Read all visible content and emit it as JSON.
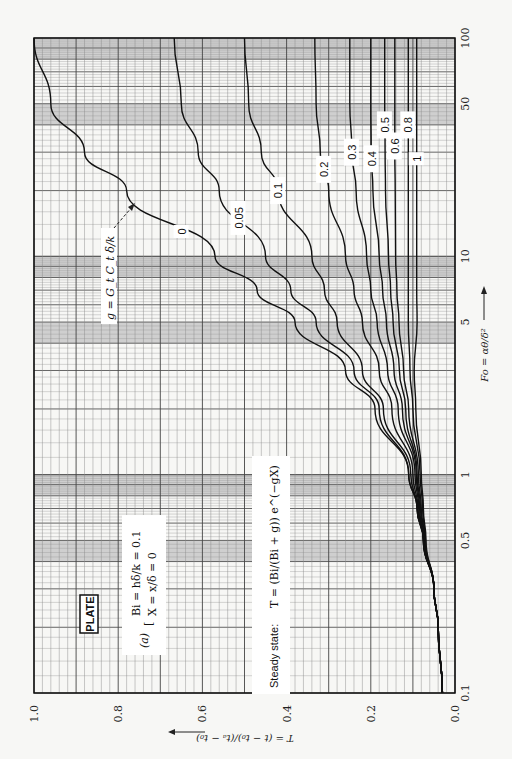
{
  "chart_data": {
    "type": "line",
    "title": "PLATE",
    "orientation": "rotated 90° counter-clockwise (x-axis runs bottom-to-top, y-axis runs right-to-left)",
    "xlabel": "Fo = αθ/δ²",
    "ylabel": "T = (t − t₀)/(tₐ − t₀)",
    "xscale": "log",
    "xlim": [
      0.1,
      100
    ],
    "ylim": [
      0.0,
      1.0
    ],
    "x_ticks": [
      0.1,
      0.5,
      1,
      5,
      10,
      50,
      100
    ],
    "x_tick_labels": [
      "0.1",
      "0.5",
      "1",
      "5",
      "10",
      "50",
      "100"
    ],
    "y_ticks": [
      0.0,
      0.2,
      0.4,
      0.6,
      0.8,
      1.0
    ],
    "y_tick_labels": [
      "0.0",
      "0.2",
      "0.4",
      "0.6",
      "0.8",
      "1.0"
    ],
    "grid": true,
    "legend": "none (inline curve labels)",
    "parameter_name": "g = G_t C_t δ/k",
    "case_label": "(a)",
    "conditions": [
      "Bi = hδ/k = 0.1",
      "X = x/δ = 0"
    ],
    "steady_state_text": "Steady state:",
    "steady_state_formula": "T = (Bi/(Bi + g)) e^(−gX)",
    "x": [
      0.1,
      0.2,
      0.3,
      0.5,
      0.7,
      1,
      2,
      3,
      5,
      7,
      10,
      20,
      30,
      50,
      100
    ],
    "series": [
      {
        "name": "0",
        "label": "0",
        "values": [
          0.03,
          0.04,
          0.05,
          0.075,
          0.09,
          0.11,
          0.19,
          0.26,
          0.38,
          0.47,
          0.57,
          0.78,
          0.88,
          0.96,
          1.0
        ]
      },
      {
        "name": "0.05",
        "label": "0.05",
        "values": [
          0.03,
          0.04,
          0.05,
          0.075,
          0.09,
          0.11,
          0.18,
          0.24,
          0.33,
          0.39,
          0.45,
          0.56,
          0.61,
          0.65,
          0.667
        ]
      },
      {
        "name": "0.1",
        "label": "0.1",
        "values": [
          0.03,
          0.04,
          0.05,
          0.075,
          0.09,
          0.105,
          0.17,
          0.22,
          0.28,
          0.31,
          0.34,
          0.42,
          0.46,
          0.49,
          0.5
        ]
      },
      {
        "name": "0.2",
        "label": "0.2",
        "values": [
          0.03,
          0.04,
          0.05,
          0.075,
          0.088,
          0.1,
          0.15,
          0.18,
          0.22,
          0.24,
          0.26,
          0.3,
          0.32,
          0.33,
          0.333
        ]
      },
      {
        "name": "0.3",
        "label": "0.3",
        "values": [
          0.03,
          0.04,
          0.05,
          0.074,
          0.086,
          0.095,
          0.135,
          0.16,
          0.185,
          0.2,
          0.21,
          0.235,
          0.245,
          0.25,
          0.25
        ]
      },
      {
        "name": "0.4",
        "label": "0.4",
        "values": [
          0.03,
          0.04,
          0.05,
          0.073,
          0.084,
          0.092,
          0.125,
          0.145,
          0.163,
          0.172,
          0.18,
          0.195,
          0.199,
          0.2,
          0.2
        ]
      },
      {
        "name": "0.5",
        "label": "0.5",
        "values": [
          0.03,
          0.04,
          0.05,
          0.072,
          0.082,
          0.09,
          0.117,
          0.132,
          0.147,
          0.153,
          0.158,
          0.165,
          0.166,
          0.167,
          0.167
        ]
      },
      {
        "name": "0.6",
        "label": "0.6",
        "values": [
          0.03,
          0.04,
          0.05,
          0.071,
          0.08,
          0.087,
          0.11,
          0.122,
          0.133,
          0.138,
          0.141,
          0.142,
          0.143,
          0.143,
          0.143
        ]
      },
      {
        "name": "0.8",
        "label": "0.8",
        "values": [
          0.03,
          0.04,
          0.05,
          0.07,
          0.077,
          0.083,
          0.1,
          0.107,
          0.111,
          0.111,
          0.111,
          0.111,
          0.111,
          0.111,
          0.111
        ]
      },
      {
        "name": "1",
        "label": "1",
        "values": [
          0.03,
          0.04,
          0.05,
          0.069,
          0.075,
          0.08,
          0.093,
          0.097,
          0.09,
          0.091,
          0.091,
          0.091,
          0.091,
          0.091,
          0.091
        ]
      }
    ],
    "label_positions_fo": {
      "0": 13,
      "0.05": 15,
      "0.1": 20,
      "0.2": 25,
      "0.3": 30,
      "0.4": 28,
      "0.5": 40,
      "0.6": 32,
      "0.8": 40,
      "1": 28
    }
  }
}
